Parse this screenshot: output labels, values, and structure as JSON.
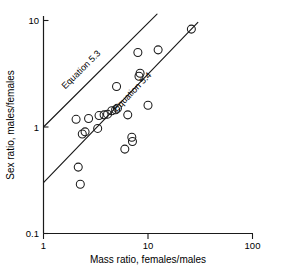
{
  "chart_data": {
    "type": "scatter",
    "title": "",
    "xlabel": "Mass ratio, females/males",
    "ylabel": "Sex ratio, males/females",
    "xscale": "log",
    "yscale": "log",
    "xlim": [
      1,
      100
    ],
    "ylim": [
      0.1,
      10
    ],
    "xticks": [
      1,
      10,
      100
    ],
    "xtick_labels": [
      "1",
      "10",
      "100"
    ],
    "yticks": [
      0.1,
      1,
      10
    ],
    "ytick_labels": [
      "0.1",
      "1",
      "10"
    ],
    "grid": false,
    "legend": "none",
    "points": [
      {
        "x": 2.05,
        "y": 1.18
      },
      {
        "x": 2.15,
        "y": 0.42
      },
      {
        "x": 2.25,
        "y": 0.29
      },
      {
        "x": 2.35,
        "y": 0.86
      },
      {
        "x": 2.5,
        "y": 0.9
      },
      {
        "x": 2.7,
        "y": 1.2
      },
      {
        "x": 3.3,
        "y": 0.97
      },
      {
        "x": 3.4,
        "y": 1.28
      },
      {
        "x": 3.8,
        "y": 1.3
      },
      {
        "x": 4.1,
        "y": 1.32
      },
      {
        "x": 4.5,
        "y": 1.42
      },
      {
        "x": 4.9,
        "y": 1.45
      },
      {
        "x": 5.0,
        "y": 2.4
      },
      {
        "x": 5.1,
        "y": 1.5
      },
      {
        "x": 6.0,
        "y": 0.62
      },
      {
        "x": 6.4,
        "y": 1.3
      },
      {
        "x": 7.0,
        "y": 0.8
      },
      {
        "x": 7.1,
        "y": 0.73
      },
      {
        "x": 8.0,
        "y": 5.0
      },
      {
        "x": 8.2,
        "y": 3.0
      },
      {
        "x": 8.4,
        "y": 3.2
      },
      {
        "x": 10.0,
        "y": 1.6
      },
      {
        "x": 12.5,
        "y": 5.3
      },
      {
        "x": 26.0,
        "y": 8.3
      }
    ],
    "lines": [
      {
        "name": "Equation 5.3",
        "label": "Equation 5.3",
        "x_start": 1.0,
        "y_start": 1.0,
        "x_end": 12.2,
        "y_end": 11.5,
        "label_x": 2.4,
        "label_y": 3.3
      },
      {
        "name": "Equation 5.4",
        "label": "Equation 5.4",
        "x_start": 1.0,
        "y_start": 0.3,
        "x_end": 30.0,
        "y_end": 9.6,
        "label_x": 7.4,
        "label_y": 2.05
      }
    ],
    "marker": {
      "shape": "open-circle",
      "radius_px": 4.0,
      "color": "#1a1a1a"
    }
  },
  "axes": {
    "x_axis_name": "x-axis",
    "y_axis_name": "y-axis"
  }
}
